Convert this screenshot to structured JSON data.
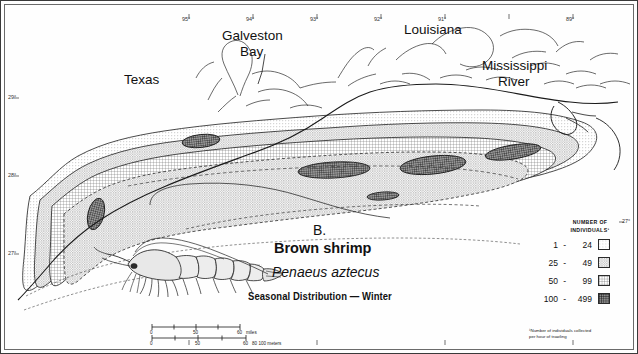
{
  "figure": {
    "panel_label": "B.",
    "common_name": "Brown shrimp",
    "scientific_name": "Penaeus aztecus",
    "subtitle": "Seasonal Distribution — Winter"
  },
  "geo_labels": [
    {
      "name": "texas",
      "text": "Texas"
    },
    {
      "name": "galveston-bay-line1",
      "text": "Galveston"
    },
    {
      "name": "galveston-bay-line2",
      "text": "Bay"
    },
    {
      "name": "louisiana",
      "text": "Louisiana"
    },
    {
      "name": "mississippi-river-line1",
      "text": "Mississippi"
    },
    {
      "name": "mississippi-river-line2",
      "text": "River"
    }
  ],
  "axes": {
    "longitude_ticks": [
      "97°",
      "96°",
      "95°",
      "94°",
      "93°",
      "92°",
      "91°",
      "90°",
      "89°",
      "88°"
    ],
    "latitude_ticks": [
      "29°",
      "28°",
      "27°"
    ],
    "right_latitude_tick": "27°"
  },
  "legend": {
    "header_line1": "NUMBER OF",
    "header_line2": "INDIVIDUALS¹",
    "classes": [
      {
        "low": "1",
        "dash": "-",
        "high": "24",
        "pattern": "stipple-light"
      },
      {
        "low": "25",
        "dash": "-",
        "high": "49",
        "pattern": "stipple-medium"
      },
      {
        "low": "50",
        "dash": "-",
        "high": "99",
        "pattern": "crosshatch-medium"
      },
      {
        "low": "100",
        "dash": "-",
        "high": "499",
        "pattern": "crosshatch-dense"
      }
    ],
    "footnote_line1": "¹Number of individuals collected",
    "footnote_line2": "per hour of trawling"
  },
  "scale_bar": {
    "miles": {
      "start": "0",
      "mid": "50",
      "end": "60",
      "unit": "miles"
    },
    "kilometers": {
      "start": "0",
      "mid": "50",
      "end": "60",
      "unit": "80 100 meters"
    }
  },
  "colors": {
    "ink": "#1a1a1a",
    "band_light": "#e4e4e4",
    "band_medium": "#c9c9c9",
    "band_dark": "#8f8f8f",
    "core": "#4a4a4a",
    "water": "#ffffff"
  }
}
